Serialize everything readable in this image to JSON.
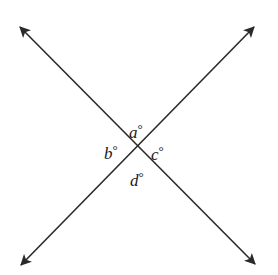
{
  "diagram": {
    "type": "intersecting-lines",
    "line_color": "#2a2a2a",
    "background": "#ffffff",
    "intersection": {
      "x": 137,
      "y": 148
    },
    "lines": [
      {
        "name": "line-1",
        "from": {
          "x": 19,
          "y": 26
        },
        "to": {
          "x": 256,
          "y": 265
        },
        "arrows": "both"
      },
      {
        "name": "line-2",
        "from": {
          "x": 255,
          "y": 26
        },
        "to": {
          "x": 20,
          "y": 266
        },
        "arrows": "both"
      }
    ],
    "angles": [
      {
        "id": "a",
        "label": "a",
        "degree_symbol": "°",
        "position": "top"
      },
      {
        "id": "b",
        "label": "b",
        "degree_symbol": "°",
        "position": "left"
      },
      {
        "id": "c",
        "label": "c",
        "degree_symbol": "°",
        "position": "right"
      },
      {
        "id": "d",
        "label": "d",
        "degree_symbol": "°",
        "position": "bottom"
      }
    ]
  }
}
